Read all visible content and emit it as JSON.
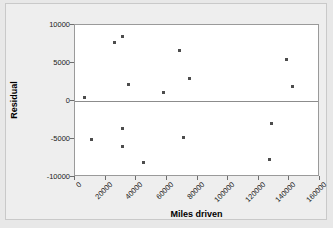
{
  "chart_data": {
    "type": "scatter",
    "title": "",
    "xlabel": "Miles driven",
    "ylabel": "Residual",
    "xlim": [
      0,
      160000
    ],
    "ylim": [
      -10000,
      10000
    ],
    "grid": false,
    "legend": false,
    "reference_line": 0,
    "x_ticks": [
      0,
      20000,
      40000,
      60000,
      80000,
      100000,
      120000,
      140000,
      160000
    ],
    "x_tick_labels": [
      "0",
      "20000",
      "40000",
      "60000",
      "80000",
      "100000",
      "120000",
      "140000",
      "160000"
    ],
    "y_ticks": [
      -10000,
      -5000,
      0,
      5000,
      10000
    ],
    "y_tick_labels": [
      "-10000",
      "-5000",
      "0",
      "5000",
      "10000"
    ],
    "series": [
      {
        "name": "Residuals",
        "marker": "square",
        "color": "#4d4d4d",
        "points": [
          {
            "x": 6000,
            "y": 400
          },
          {
            "x": 11000,
            "y": -5050
          },
          {
            "x": 26000,
            "y": 7700
          },
          {
            "x": 31000,
            "y": 8500
          },
          {
            "x": 31000,
            "y": -3600
          },
          {
            "x": 31000,
            "y": -6000
          },
          {
            "x": 35000,
            "y": 2200
          },
          {
            "x": 45000,
            "y": -8100
          },
          {
            "x": 58000,
            "y": 1150
          },
          {
            "x": 68000,
            "y": 6700
          },
          {
            "x": 71000,
            "y": -4850
          },
          {
            "x": 75000,
            "y": 3000
          },
          {
            "x": 128000,
            "y": -2900
          },
          {
            "x": 127000,
            "y": -7700
          },
          {
            "x": 138000,
            "y": 5450
          },
          {
            "x": 142000,
            "y": 1950
          }
        ]
      }
    ]
  }
}
